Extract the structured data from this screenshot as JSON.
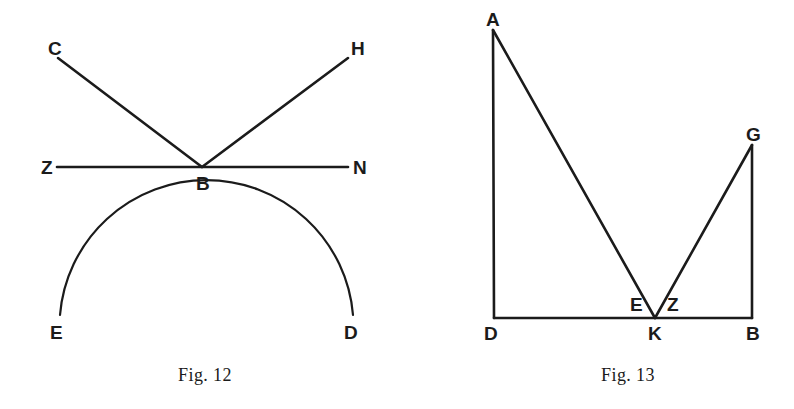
{
  "page": {
    "background_color": "#ffffff",
    "ink_color": "#1b1b1b",
    "width": 794,
    "height": 409
  },
  "figures": [
    {
      "id": "fig-12",
      "caption": "Fig. 12",
      "caption_x": 205,
      "caption_y": 381,
      "description": "Two rays CB and HB meeting at point B on straight line ZN, with a semicircular arc EBD tangent below at B",
      "points": [
        {
          "name": "C",
          "label": "C",
          "x": 58,
          "y": 58,
          "label_x": 48,
          "label_y": 55
        },
        {
          "name": "H",
          "label": "H",
          "x": 348,
          "y": 58,
          "label_x": 351,
          "label_y": 55
        },
        {
          "name": "Z",
          "label": "Z",
          "x": 57,
          "y": 167,
          "label_x": 41,
          "label_y": 174
        },
        {
          "name": "N",
          "label": "N",
          "x": 348,
          "y": 167,
          "label_x": 353,
          "label_y": 174
        },
        {
          "name": "B",
          "label": "B",
          "x": 202,
          "y": 167,
          "label_x": 196,
          "label_y": 190
        },
        {
          "name": "E",
          "label": "E",
          "x": 60,
          "y": 315,
          "label_x": 50,
          "label_y": 339
        },
        {
          "name": "D",
          "label": "D",
          "x": 353,
          "y": 315,
          "label_x": 344,
          "label_y": 339
        }
      ],
      "segments": [
        {
          "name": "ray-CB",
          "from": "C",
          "to": "B"
        },
        {
          "name": "ray-HB",
          "from": "H",
          "to": "B"
        },
        {
          "name": "line-ZN",
          "from": "Z",
          "to": "N"
        }
      ],
      "arcs": [
        {
          "name": "arc-EBD",
          "from": "E",
          "to": "D",
          "apex": "B",
          "radius": 147,
          "sweep": "upward"
        }
      ]
    },
    {
      "id": "fig-13",
      "caption": "Fig. 13",
      "caption_x": 628,
      "caption_y": 381,
      "description": "Rectangle-like frame D-B with verticals DA and BG, and a V shape A-K-G meeting the base at K; angles E and Z marked at K",
      "points": [
        {
          "name": "A",
          "label": "A",
          "x": 493,
          "y": 30,
          "label_x": 486,
          "label_y": 26
        },
        {
          "name": "G",
          "label": "G",
          "x": 752,
          "y": 145,
          "label_x": 746,
          "label_y": 141
        },
        {
          "name": "D",
          "label": "D",
          "x": 494,
          "y": 318,
          "label_x": 484,
          "label_y": 340
        },
        {
          "name": "B",
          "label": "B",
          "x": 752,
          "y": 318,
          "label_x": 746,
          "label_y": 340
        },
        {
          "name": "K",
          "label": "K",
          "x": 655,
          "y": 318,
          "label_x": 648,
          "label_y": 340
        },
        {
          "name": "E",
          "label": "E",
          "x": 638,
          "y": 308,
          "label_x": 630,
          "label_y": 311
        },
        {
          "name": "Z",
          "label": "Z",
          "x": 674,
          "y": 308,
          "label_x": 667,
          "label_y": 311
        }
      ],
      "segments": [
        {
          "name": "side-DA",
          "from": "D",
          "to": "A"
        },
        {
          "name": "side-BG",
          "from": "B",
          "to": "G"
        },
        {
          "name": "base-DB",
          "from": "D",
          "to": "B"
        },
        {
          "name": "segment-AK",
          "from": "A",
          "to": "K"
        },
        {
          "name": "segment-KG",
          "from": "K",
          "to": "G"
        }
      ],
      "arcs": []
    }
  ]
}
